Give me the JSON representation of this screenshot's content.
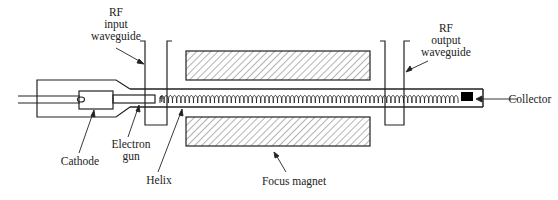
{
  "diagram": {
    "labels": {
      "rf_input": [
        "RF",
        "input",
        "waveguide"
      ],
      "rf_output": [
        "RF",
        "output",
        "waveguide"
      ],
      "cathode": "Cathode",
      "electron_gun": [
        "Electron",
        "gun"
      ],
      "helix": "Helix",
      "focus_magnet": "Focus magnet",
      "collector": "Collector"
    },
    "colors": {
      "line": "#222222",
      "collector_fill": "#000000",
      "hatch": "#444444"
    }
  }
}
